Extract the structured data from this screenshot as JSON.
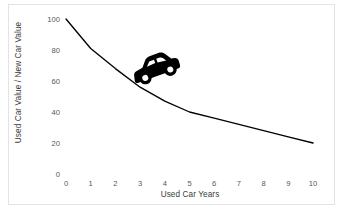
{
  "chart_data": {
    "type": "line",
    "title": "",
    "xlabel": "Used Car Years",
    "ylabel": "Used Car Value / New Car Value",
    "xlim": [
      0,
      10
    ],
    "ylim": [
      0,
      100
    ],
    "xticks": [
      "0",
      "1",
      "2",
      "3",
      "4",
      "5",
      "6",
      "7",
      "8",
      "9",
      "10"
    ],
    "yticks": [
      "0",
      "20",
      "40",
      "60",
      "80",
      "100"
    ],
    "grid": false,
    "legend": null,
    "series": [
      {
        "name": "Used car value retention",
        "color": "#000000",
        "x": [
          0,
          1,
          2,
          3,
          4,
          5,
          6,
          7,
          8,
          9,
          10
        ],
        "values": [
          100,
          81,
          68,
          56,
          47,
          40,
          36,
          32,
          28,
          24,
          20
        ]
      }
    ],
    "annotations": [
      {
        "name": "car-icon",
        "type": "image-marker",
        "shape": "car-silhouette",
        "color": "#000000",
        "x_range": [
          3.0,
          4.6
        ],
        "y_range": [
          58,
          78
        ],
        "rotation_degrees": -20
      }
    ]
  },
  "axes": {
    "y_axis_label": "Used Car Value / New Car Value",
    "x_axis_label": "Used Car Years"
  },
  "colors": {
    "line": "#000000",
    "tick_text": "#575757",
    "axis_label_text": "#3b3b3b",
    "frame": "#e3e3e3",
    "background": "#ffffff"
  }
}
